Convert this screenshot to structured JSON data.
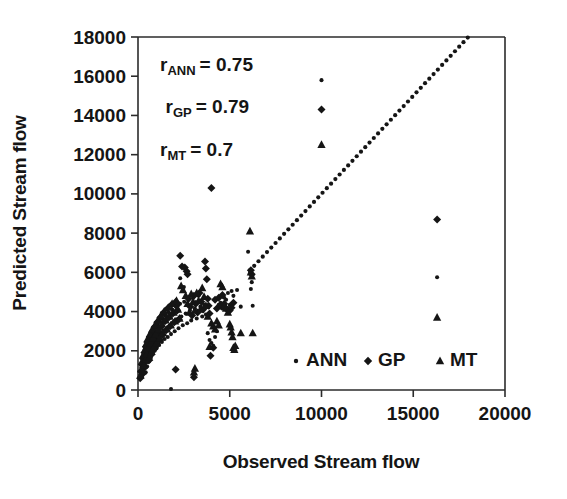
{
  "chart_data": {
    "type": "scatter",
    "title": "",
    "xlabel": "Observed Stream flow",
    "ylabel": "Predicted Stream flow",
    "xlim": [
      0,
      20000
    ],
    "ylim": [
      0,
      18000
    ],
    "xticks": [
      0,
      5000,
      10000,
      15000,
      20000
    ],
    "yticks": [
      0,
      2000,
      4000,
      6000,
      8000,
      10000,
      12000,
      14000,
      16000,
      18000
    ],
    "xtick_labels": [
      "0",
      "5000",
      "10000",
      "15000",
      "20000"
    ],
    "ytick_labels": [
      "0",
      "2000",
      "4000",
      "6000",
      "8000",
      "10000",
      "12000",
      "14000",
      "16000",
      "18000"
    ],
    "grid": false,
    "legend_position": "inside-bottom-right",
    "legend": [
      {
        "name": "ANN",
        "marker": "circle"
      },
      {
        "name": "GP",
        "marker": "diamond"
      },
      {
        "name": "MT",
        "marker": "triangle"
      }
    ],
    "annotations": [
      {
        "id": "r-ann",
        "base": "r",
        "sub": "ANN",
        "rest": "= 0.75",
        "text": "r ANN = 0.75",
        "x": 1200,
        "y": 16250
      },
      {
        "id": "r-gp",
        "base": "r",
        "sub": "GP",
        "rest": "= 0.79",
        "text": "r GP = 0.79",
        "x": 1500,
        "y": 14100
      },
      {
        "id": "r-mt",
        "base": "r",
        "sub": "MT",
        "rest": "= 0.7",
        "text": "r MT = 0.7",
        "x": 1200,
        "y": 11950
      }
    ],
    "reference_line": {
      "name": "1:1 line",
      "style": "dotted",
      "x_start": 6100,
      "x_end": 19600,
      "slope": 1,
      "intercept": 0
    },
    "series": [
      {
        "name": "ANN",
        "marker": "circle",
        "points": [
          [
            150,
            900
          ],
          [
            180,
            1150
          ],
          [
            210,
            700
          ],
          [
            240,
            1400
          ],
          [
            260,
            1000
          ],
          [
            300,
            1750
          ],
          [
            330,
            1250
          ],
          [
            360,
            2050
          ],
          [
            390,
            1500
          ],
          [
            420,
            900
          ],
          [
            450,
            2250
          ],
          [
            470,
            1700
          ],
          [
            500,
            1200
          ],
          [
            530,
            2500
          ],
          [
            560,
            1900
          ],
          [
            600,
            1450
          ],
          [
            630,
            2700
          ],
          [
            660,
            2100
          ],
          [
            700,
            1650
          ],
          [
            730,
            2900
          ],
          [
            760,
            2300
          ],
          [
            800,
            1850
          ],
          [
            840,
            3050
          ],
          [
            870,
            2450
          ],
          [
            910,
            2000
          ],
          [
            950,
            3200
          ],
          [
            990,
            2600
          ],
          [
            1030,
            2150
          ],
          [
            1070,
            3350
          ],
          [
            1110,
            2750
          ],
          [
            1150,
            2300
          ],
          [
            1200,
            3500
          ],
          [
            1250,
            2900
          ],
          [
            1300,
            2450
          ],
          [
            1350,
            3650
          ],
          [
            1400,
            3050
          ],
          [
            1450,
            2600
          ],
          [
            1500,
            3800
          ],
          [
            1560,
            3150
          ],
          [
            1620,
            2700
          ],
          [
            1680,
            3950
          ],
          [
            1740,
            3300
          ],
          [
            1800,
            2850
          ],
          [
            1870,
            4100
          ],
          [
            1930,
            3450
          ],
          [
            2000,
            3000
          ],
          [
            2070,
            4250
          ],
          [
            2140,
            3600
          ],
          [
            2210,
            3150
          ],
          [
            2290,
            4400
          ],
          [
            2360,
            3750
          ],
          [
            2440,
            3300
          ],
          [
            2520,
            4500
          ],
          [
            2600,
            3900
          ],
          [
            2680,
            3400
          ],
          [
            2300,
            5700
          ],
          [
            2500,
            5250
          ],
          [
            2750,
            4600
          ],
          [
            2830,
            4050
          ],
          [
            2900,
            3550
          ],
          [
            3000,
            4700
          ],
          [
            3100,
            4150
          ],
          [
            3200,
            3650
          ],
          [
            3300,
            4800
          ],
          [
            3400,
            4250
          ],
          [
            3500,
            3750
          ],
          [
            3600,
            4350
          ],
          [
            3700,
            3850
          ],
          [
            3800,
            2900
          ],
          [
            3900,
            2550
          ],
          [
            4000,
            2400
          ],
          [
            4100,
            2250
          ],
          [
            4200,
            2700
          ],
          [
            4300,
            3000
          ],
          [
            4400,
            4350
          ],
          [
            4500,
            4450
          ],
          [
            4600,
            4150
          ],
          [
            4700,
            4700
          ],
          [
            4800,
            4600
          ],
          [
            4900,
            4950
          ],
          [
            5000,
            4350
          ],
          [
            5100,
            5050
          ],
          [
            5200,
            4800
          ],
          [
            5400,
            5100
          ],
          [
            5600,
            4250
          ],
          [
            6000,
            7050
          ],
          [
            6100,
            5950
          ],
          [
            6150,
            5150
          ],
          [
            6200,
            5500
          ],
          [
            6250,
            4300
          ],
          [
            1800,
            50
          ],
          [
            2100,
            1050
          ],
          [
            10000,
            15800
          ],
          [
            16300,
            5750
          ]
        ]
      },
      {
        "name": "GP",
        "marker": "diamond",
        "points": [
          [
            120,
            600
          ],
          [
            160,
            950
          ],
          [
            200,
            1300
          ],
          [
            230,
            800
          ],
          [
            270,
            1600
          ],
          [
            310,
            1100
          ],
          [
            350,
            1900
          ],
          [
            390,
            1400
          ],
          [
            430,
            2200
          ],
          [
            470,
            1700
          ],
          [
            510,
            2450
          ],
          [
            550,
            2000
          ],
          [
            590,
            1500
          ],
          [
            640,
            2700
          ],
          [
            680,
            2250
          ],
          [
            720,
            1800
          ],
          [
            770,
            2950
          ],
          [
            810,
            2500
          ],
          [
            860,
            2050
          ],
          [
            900,
            3200
          ],
          [
            950,
            2750
          ],
          [
            1000,
            2300
          ],
          [
            1050,
            3450
          ],
          [
            1100,
            3000
          ],
          [
            1160,
            2550
          ],
          [
            1220,
            3700
          ],
          [
            1280,
            3250
          ],
          [
            1340,
            2800
          ],
          [
            1400,
            3950
          ],
          [
            1470,
            3500
          ],
          [
            1540,
            3050
          ],
          [
            1610,
            4150
          ],
          [
            1680,
            3700
          ],
          [
            1750,
            3250
          ],
          [
            1830,
            4350
          ],
          [
            1900,
            3900
          ],
          [
            1980,
            3450
          ],
          [
            2060,
            4500
          ],
          [
            2140,
            4050
          ],
          [
            2220,
            3600
          ],
          [
            2100,
            4300
          ],
          [
            2300,
            6850
          ],
          [
            2400,
            6300
          ],
          [
            2550,
            6250
          ],
          [
            2650,
            6050
          ],
          [
            2700,
            5900
          ],
          [
            2750,
            4650
          ],
          [
            2850,
            4250
          ],
          [
            2950,
            3800
          ],
          [
            3050,
            4800
          ],
          [
            3150,
            4400
          ],
          [
            3250,
            3950
          ],
          [
            3350,
            4950
          ],
          [
            3450,
            4500
          ],
          [
            3550,
            4100
          ],
          [
            3650,
            6550
          ],
          [
            3700,
            6200
          ],
          [
            3750,
            5650
          ],
          [
            3800,
            4650
          ],
          [
            3850,
            4300
          ],
          [
            3900,
            3900
          ],
          [
            3950,
            1750
          ],
          [
            4000,
            10300
          ],
          [
            4100,
            2150
          ],
          [
            4200,
            4600
          ],
          [
            4300,
            4150
          ],
          [
            4400,
            4700
          ],
          [
            4500,
            4300
          ],
          [
            4600,
            4850
          ],
          [
            4700,
            4400
          ],
          [
            4800,
            4150
          ],
          [
            4900,
            4100
          ],
          [
            5000,
            4050
          ],
          [
            5100,
            4200
          ],
          [
            5200,
            4450
          ],
          [
            3050,
            650
          ],
          [
            2050,
            1050
          ],
          [
            6150,
            6100
          ],
          [
            6200,
            5900
          ],
          [
            10000,
            14300
          ],
          [
            16300,
            8700
          ]
        ]
      },
      {
        "name": "MT",
        "marker": "triangle",
        "points": [
          [
            140,
            750
          ],
          [
            190,
            1050
          ],
          [
            220,
            1450
          ],
          [
            250,
            950
          ],
          [
            290,
            1800
          ],
          [
            320,
            1250
          ],
          [
            370,
            2050
          ],
          [
            410,
            1550
          ],
          [
            440,
            2350
          ],
          [
            480,
            1850
          ],
          [
            520,
            2600
          ],
          [
            570,
            2150
          ],
          [
            610,
            1650
          ],
          [
            650,
            2850
          ],
          [
            690,
            2400
          ],
          [
            740,
            1950
          ],
          [
            780,
            3100
          ],
          [
            830,
            2650
          ],
          [
            880,
            2200
          ],
          [
            920,
            3300
          ],
          [
            970,
            2850
          ],
          [
            1020,
            2400
          ],
          [
            1080,
            3550
          ],
          [
            1130,
            3100
          ],
          [
            1190,
            2650
          ],
          [
            1250,
            3800
          ],
          [
            1310,
            3350
          ],
          [
            1370,
            2900
          ],
          [
            1430,
            4000
          ],
          [
            1500,
            3550
          ],
          [
            1580,
            3100
          ],
          [
            1650,
            4200
          ],
          [
            1720,
            3750
          ],
          [
            1790,
            3300
          ],
          [
            1860,
            4400
          ],
          [
            1940,
            3950
          ],
          [
            2020,
            3500
          ],
          [
            2100,
            4550
          ],
          [
            2180,
            4100
          ],
          [
            2260,
            3650
          ],
          [
            2350,
            5300
          ],
          [
            2450,
            5100
          ],
          [
            2600,
            4800
          ],
          [
            2700,
            4400
          ],
          [
            2800,
            3950
          ],
          [
            2900,
            4900
          ],
          [
            3000,
            4500
          ],
          [
            3100,
            4050
          ],
          [
            3200,
            4950
          ],
          [
            3300,
            4550
          ],
          [
            3400,
            4100
          ],
          [
            3500,
            5200
          ],
          [
            3600,
            4750
          ],
          [
            3700,
            4300
          ],
          [
            3800,
            3750
          ],
          [
            3100,
            1100
          ],
          [
            3050,
            900
          ],
          [
            3900,
            2200
          ],
          [
            4000,
            3400
          ],
          [
            4100,
            3250
          ],
          [
            4200,
            3100
          ],
          [
            4300,
            3500
          ],
          [
            4400,
            3300
          ],
          [
            4500,
            5400
          ],
          [
            4600,
            5250
          ],
          [
            4700,
            4300
          ],
          [
            4800,
            4150
          ],
          [
            4900,
            3950
          ],
          [
            5000,
            3350
          ],
          [
            5050,
            3200
          ],
          [
            5100,
            2950
          ],
          [
            5150,
            2700
          ],
          [
            5200,
            2150
          ],
          [
            5250,
            2050
          ],
          [
            5300,
            2250
          ],
          [
            5600,
            2900
          ],
          [
            6100,
            8100
          ],
          [
            6150,
            6000
          ],
          [
            6200,
            5800
          ],
          [
            6250,
            2900
          ],
          [
            10000,
            12500
          ],
          [
            16300,
            3700
          ]
        ]
      }
    ]
  },
  "plot_geometry": {
    "left_px": 138,
    "right_px": 505,
    "top_px": 37,
    "bottom_px": 390
  }
}
